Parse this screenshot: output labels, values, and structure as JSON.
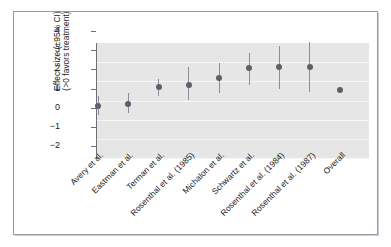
{
  "figure": {
    "background_color": "#ffffff",
    "frame_color": "#9a9aa4",
    "plot_background_color": "#e6e6e6",
    "gridline_color": "#f7f7f7",
    "marker_color": "#5f5f6b",
    "ci_color": "#8c8c96"
  },
  "axis": {
    "ylabel_line1": "Effect size (±95% CI)",
    "ylabel_line2": "(>0 favors treatment)",
    "yticks": [
      "4",
      "3",
      "2",
      "1",
      "0",
      "−1",
      "−2"
    ],
    "xlabel": ""
  },
  "chart_data": {
    "type": "scatter",
    "title": "",
    "xlabel": "",
    "ylabel": "Effect size (±95% CI) (>0 favors treatment)",
    "ylim": [
      -2,
      4
    ],
    "yticks": [
      4,
      3,
      2,
      1,
      0,
      -1,
      -2
    ],
    "grid": true,
    "legend": "none",
    "reference_line": null,
    "categories": [
      "Avery et al.",
      "Eastman et al.",
      "Terman et al.",
      "Rosenthal et al. (1985)",
      "Michalon et al.",
      "Schwartz et al.",
      "Rosenthal et al. (1984)",
      "Rosenthal et al. (1987)",
      "Overall"
    ],
    "series": [
      {
        "name": "Effect size",
        "values": [
          0.1,
          0.2,
          1.1,
          1.2,
          1.55,
          2.05,
          2.1,
          2.1,
          0.9
        ],
        "ci_lower": [
          -0.4,
          -0.3,
          0.6,
          0.4,
          0.75,
          1.2,
          0.95,
          0.8,
          0.75
        ],
        "ci_upper": [
          0.6,
          0.75,
          1.5,
          2.1,
          2.35,
          2.85,
          3.2,
          3.45,
          1.1
        ]
      }
    ],
    "points": [
      {
        "label": "Avery et al.",
        "value": 0.1,
        "ci_lower": -0.4,
        "ci_upper": 0.6
      },
      {
        "label": "Eastman et al.",
        "value": 0.2,
        "ci_lower": -0.3,
        "ci_upper": 0.75
      },
      {
        "label": "Terman et al.",
        "value": 1.1,
        "ci_lower": 0.6,
        "ci_upper": 1.5
      },
      {
        "label": "Rosenthal et al. (1985)",
        "value": 1.2,
        "ci_lower": 0.4,
        "ci_upper": 2.1
      },
      {
        "label": "Michalon et al.",
        "value": 1.55,
        "ci_lower": 0.75,
        "ci_upper": 2.35
      },
      {
        "label": "Schwartz et al.",
        "value": 2.05,
        "ci_lower": 1.2,
        "ci_upper": 2.85
      },
      {
        "label": "Rosenthal et al. (1984)",
        "value": 2.1,
        "ci_lower": 0.95,
        "ci_upper": 3.2
      },
      {
        "label": "Rosenthal et al. (1987)",
        "value": 2.1,
        "ci_lower": 0.8,
        "ci_upper": 3.45
      },
      {
        "label": "Overall",
        "value": 0.9,
        "ci_lower": 0.75,
        "ci_upper": 1.1
      }
    ]
  }
}
